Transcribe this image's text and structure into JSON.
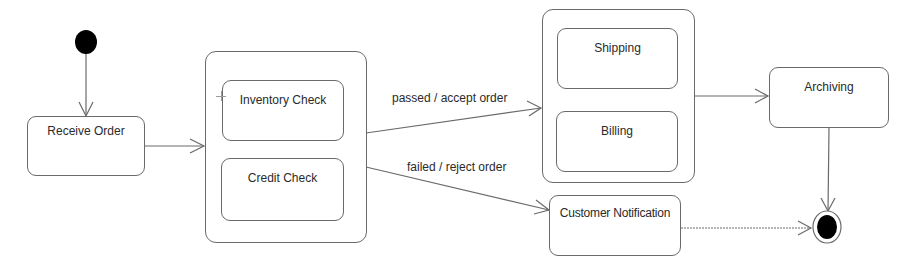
{
  "diagram": {
    "type": "UML state machine",
    "colors": {
      "line": "#6a6a6a",
      "text": "#2a2a2a",
      "fill": "#ffffff",
      "node_fill": "#000000"
    },
    "initial_state": {
      "name": "initial"
    },
    "final_state": {
      "name": "final"
    },
    "states": {
      "receive_order": {
        "label": "Receive Order"
      },
      "order_verification": {
        "label": "",
        "substates": {
          "inventory_check": {
            "label": "Inventory Check"
          },
          "credit_check": {
            "label": "Credit Check"
          }
        }
      },
      "fulfillment": {
        "label": "",
        "substates": {
          "shipping": {
            "label": "Shipping"
          },
          "billing": {
            "label": "Billing"
          }
        }
      },
      "archiving": {
        "label": "Archiving"
      },
      "customer_notification": {
        "label": "Customer Notification"
      }
    },
    "transitions": [
      {
        "from": "initial",
        "to": "Receive Order",
        "label": ""
      },
      {
        "from": "Receive Order",
        "to": "Verification composite",
        "label": ""
      },
      {
        "from": "Verification composite",
        "to": "Fulfillment composite",
        "label": "passed / accept order"
      },
      {
        "from": "Verification composite",
        "to": "Customer Notification",
        "label": "failed / reject order"
      },
      {
        "from": "Fulfillment composite",
        "to": "Archiving",
        "label": ""
      },
      {
        "from": "Archiving",
        "to": "final",
        "label": ""
      },
      {
        "from": "Customer Notification",
        "to": "final",
        "label": ""
      }
    ]
  }
}
